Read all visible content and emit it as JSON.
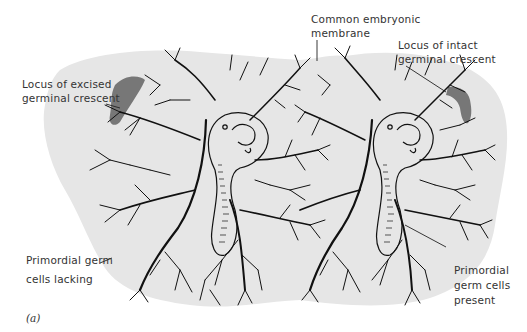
{
  "figure": {
    "panel_label": "(a)",
    "labels": {
      "excised_crescent": [
        "Locus of excised",
        "germinal crescent"
      ],
      "common_membrane": [
        "Common embryonic",
        "membrane"
      ],
      "intact_crescent": [
        "Locus of intact",
        "germinal crescent"
      ],
      "germ_cells_lacking": [
        "Primordial germ",
        "cells lacking"
      ],
      "germ_cells_present": [
        "Primordial",
        "germ cells",
        "present"
      ]
    },
    "colors": {
      "membrane_fill": "#e6e6e6",
      "crescent_fill": "#777777",
      "vessel_stroke": "#111111",
      "background": "#ffffff"
    },
    "embryos": [
      {
        "name": "left-embryo",
        "crescent": "excised",
        "germ_cells": "lacking"
      },
      {
        "name": "right-embryo",
        "crescent": "intact",
        "germ_cells": "present"
      }
    ]
  }
}
